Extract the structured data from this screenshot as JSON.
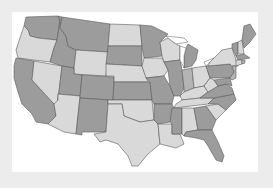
{
  "map": {
    "type": "us-states-choropleth",
    "palette": {
      "light": "#d9d9d9",
      "mid": "#b4b4b4",
      "dark": "#9c9c9c",
      "lake": "#ffffff",
      "border": "#5a5a5a",
      "frame_bg": "#ffffff",
      "page_bg": "#ececec"
    },
    "states": [
      {
        "id": "WA",
        "shade": "dark",
        "points": "26,17 58,16 60,20 57,40 38,38 30,36 28,30 24,26"
      },
      {
        "id": "OR",
        "shade": "light",
        "points": "24,26 28,30 30,36 38,38 57,40 54,48 50,62 18,58 16,50 20,38"
      },
      {
        "id": "CA",
        "shade": "dark",
        "points": "16,58 34,61 32,80 54,104 56,116 48,124 36,122 32,114 22,104 18,92 14,78 14,66"
      },
      {
        "id": "NV",
        "shade": "light",
        "points": "34,61 62,66 58,100 56,104 54,104 32,80"
      },
      {
        "id": "ID",
        "shade": "dark",
        "points": "58,16 62,17 60,28 66,36 68,46 76,50 74,68 62,66 50,62 54,48 57,40 60,20"
      },
      {
        "id": "MT",
        "shade": "dark",
        "points": "62,17 110,24 108,52 76,50 68,46 66,36 60,28"
      },
      {
        "id": "WY",
        "shade": "light",
        "points": "76,50 108,52 106,76 74,74 74,68"
      },
      {
        "id": "UT",
        "shade": "dark",
        "points": "62,66 74,68 74,74 82,75 80,96 58,94 58,100"
      },
      {
        "id": "AZ",
        "shade": "light",
        "points": "58,94 80,96 76,134 64,132 48,124 56,116 54,104 58,100"
      },
      {
        "id": "CO",
        "shade": "dark",
        "points": "82,75 114,77 113,100 80,98"
      },
      {
        "id": "NM",
        "shade": "dark",
        "points": "80,98 108,100 106,132 82,132 82,135 76,134"
      },
      {
        "id": "ND",
        "shade": "light",
        "points": "110,24 140,25 142,46 108,46"
      },
      {
        "id": "SD",
        "shade": "dark",
        "points": "108,46 142,46 142,66 106,64"
      },
      {
        "id": "NE",
        "shade": "light",
        "points": "106,64 142,66 148,82 114,82 114,76 106,76"
      },
      {
        "id": "KS",
        "shade": "dark",
        "points": "114,82 150,82 152,100 113,100"
      },
      {
        "id": "OK",
        "shade": "light",
        "points": "108,100 152,100 154,120 140,122 124,116 122,104 108,104"
      },
      {
        "id": "TX",
        "shade": "light",
        "points": "108,104 122,104 124,116 140,122 154,120 158,124 160,144 148,154 138,166 132,166 128,156 118,144 106,140 100,142 94,134 106,132"
      },
      {
        "id": "MN",
        "shade": "dark",
        "points": "140,25 152,26 168,34 160,42 162,56 144,58 142,46"
      },
      {
        "id": "IA",
        "shade": "light",
        "points": "144,58 162,58 168,70 164,76 146,78 142,66"
      },
      {
        "id": "MO",
        "shade": "dark",
        "points": "146,78 164,76 170,86 174,96 172,104 154,104 152,100 150,82"
      },
      {
        "id": "AR",
        "shade": "dark",
        "points": "154,104 172,104 174,108 170,122 158,124 154,120"
      },
      {
        "id": "LA",
        "shade": "light",
        "points": "158,124 172,124 172,134 180,134 184,144 176,148 160,144"
      },
      {
        "id": "WI",
        "shade": "light",
        "points": "160,42 168,38 176,44 180,46 180,60 164,62 162,56"
      },
      {
        "id": "IL",
        "shade": "dark",
        "points": "164,62 180,60 182,70 184,88 180,96 174,96 170,86 168,70"
      },
      {
        "id": "MI",
        "shade": "dark",
        "points": "188,44 198,50 196,60 192,66 184,68 184,56 186,48"
      },
      {
        "id": "IN",
        "shade": "mid",
        "points": "182,70 192,68 194,88 184,92 184,88"
      },
      {
        "id": "OH",
        "shade": "light",
        "points": "192,68 206,66 210,78 204,86 194,88"
      },
      {
        "id": "KY",
        "shade": "light",
        "points": "180,96 184,92 194,88 204,86 208,92 200,98 182,100"
      },
      {
        "id": "TN",
        "shade": "light",
        "points": "176,104 182,100 200,98 214,98 208,104 174,108"
      },
      {
        "id": "MS",
        "shade": "dark",
        "points": "172,108 182,108 182,134 172,134 172,124 170,122"
      },
      {
        "id": "AL",
        "shade": "light",
        "points": "182,108 194,108 198,130 186,132 184,136 182,134"
      },
      {
        "id": "GA",
        "shade": "dark",
        "points": "194,108 206,106 216,120 212,130 198,130"
      },
      {
        "id": "FL",
        "shade": "dark",
        "points": "184,136 186,132 198,130 212,130 218,142 224,156 222,162 216,160 208,146 204,140 196,138"
      },
      {
        "id": "SC",
        "shade": "light",
        "points": "206,106 218,104 226,110 216,120"
      },
      {
        "id": "NC",
        "shade": "dark",
        "points": "208,104 214,98 234,94 236,100 226,110 218,104"
      },
      {
        "id": "VA",
        "shade": "dark",
        "points": "200,98 208,92 218,86 226,84 232,88 234,94 214,98"
      },
      {
        "id": "WV",
        "shade": "light",
        "points": "204,86 210,78 214,80 218,86 208,92"
      },
      {
        "id": "PA",
        "shade": "dark",
        "points": "206,66 230,64 234,72 230,78 210,78"
      },
      {
        "id": "NY",
        "shade": "light",
        "points": "210,62 222,50 232,48 236,60 238,66 232,66 230,64 208,66"
      },
      {
        "id": "MD",
        "shade": "dark",
        "points": "214,80 230,78 232,86 226,84 218,86"
      },
      {
        "id": "NJ",
        "shade": "mid",
        "points": "232,66 236,66 236,78 232,80 230,78 234,72"
      },
      {
        "id": "VT",
        "shade": "dark",
        "points": "232,44 238,42 238,54 236,56 232,48"
      },
      {
        "id": "NH",
        "shade": "light",
        "points": "238,42 242,40 244,54 238,54"
      },
      {
        "id": "ME",
        "shade": "dark",
        "points": "242,40 244,26 250,24 256,34 250,42 244,48"
      },
      {
        "id": "MA",
        "shade": "dark",
        "points": "236,56 244,54 250,58 238,60"
      },
      {
        "id": "CT",
        "shade": "light",
        "points": "236,60 242,60 242,64 236,66"
      },
      {
        "id": "RI",
        "shade": "mid",
        "points": "242,60 245,60 245,63 242,64"
      }
    ],
    "lakes": [
      {
        "id": "lake-michigan",
        "points": "180,46 186,48 184,56 184,68 180,60"
      },
      {
        "id": "lake-superior",
        "points": "166,36 184,38 188,42 176,44 168,38"
      },
      {
        "id": "lake-erie",
        "points": "204,62 214,58 210,62 206,66"
      }
    ]
  }
}
